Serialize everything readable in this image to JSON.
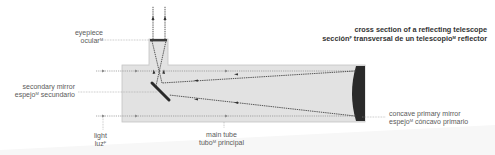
{
  "title": {
    "en": "cross section of a reflecting telescope",
    "es_1": "sección",
    "es_1_gender": "F",
    "es_2": " transversal de un telescopio",
    "es_2_gender": "M",
    "es_3": " reflector"
  },
  "labels": {
    "eyepiece": {
      "en": "eyepiece",
      "es": "ocular",
      "gender": "M"
    },
    "secondary_mirror": {
      "en": "secondary mirror",
      "es_1": "espejo",
      "gender": "M",
      "es_2": " secundario"
    },
    "light": {
      "en": "light",
      "es": "luz",
      "gender": "F"
    },
    "main_tube": {
      "en": "main tube",
      "es_1": "tubo",
      "gender": "M",
      "es_2": " principal"
    },
    "primary_mirror": {
      "en": "concave primary mirror",
      "es_1": "espejo",
      "gender": "M",
      "es_2": " cóncavo primario"
    }
  },
  "colors": {
    "tube_fill": "#e2e2e2",
    "tube_edge": "#c4c4c4",
    "mirror": "#2a2a2a",
    "ray": "#555555",
    "leader": "#9a9a9a"
  }
}
